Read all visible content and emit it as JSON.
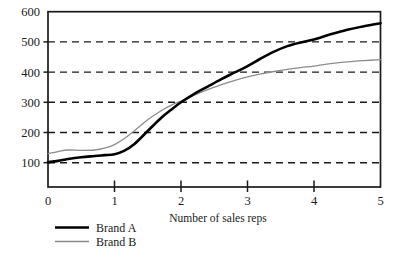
{
  "chart_data": {
    "type": "line",
    "title": "",
    "xlabel": "Number of sales reps",
    "ylabel": "",
    "xlim": [
      0,
      5
    ],
    "ylim": [
      20,
      600
    ],
    "xticks": [
      "0",
      "1",
      "2",
      "3",
      "4",
      "5"
    ],
    "yticks": [
      "100",
      "200",
      "300",
      "400",
      "500",
      "600"
    ],
    "grid": "horizontal-dashed",
    "legend_position": "below-left",
    "x": [
      0,
      0.15,
      0.3,
      0.5,
      0.7,
      0.85,
      1.0,
      1.15,
      1.3,
      1.5,
      1.7,
      1.85,
      2.0,
      2.2,
      2.4,
      2.6,
      2.8,
      3.0,
      3.2,
      3.4,
      3.6,
      3.8,
      4.0,
      4.25,
      4.5,
      4.75,
      5.0
    ],
    "series": [
      {
        "name": "Brand A",
        "color": "#000000",
        "width": 2.6,
        "values": [
          102,
          106,
          112,
          118,
          122,
          125,
          128,
          140,
          162,
          205,
          248,
          275,
          300,
          328,
          352,
          376,
          398,
          420,
          445,
          468,
          486,
          498,
          508,
          525,
          540,
          552,
          562
        ]
      },
      {
        "name": "Brand B",
        "color": "#8c8c8c",
        "width": 1.3,
        "values": [
          130,
          137,
          142,
          141,
          142,
          148,
          160,
          180,
          206,
          242,
          272,
          290,
          304,
          324,
          342,
          358,
          372,
          384,
          394,
          402,
          409,
          415,
          420,
          428,
          434,
          438,
          441
        ]
      }
    ],
    "crossing_point": {
      "x": 2.1,
      "y": 308
    }
  },
  "legend": {
    "items": [
      {
        "label": "Brand A",
        "swatch": "legend-line-brand-a"
      },
      {
        "label": "Brand B",
        "swatch": "legend-line-brand-b"
      }
    ]
  },
  "colors": {
    "brand_a": "#000000",
    "brand_b": "#8c8c8c",
    "axis": "#1a1a1a",
    "grid": "#1a1a1a",
    "background": "#ffffff"
  }
}
